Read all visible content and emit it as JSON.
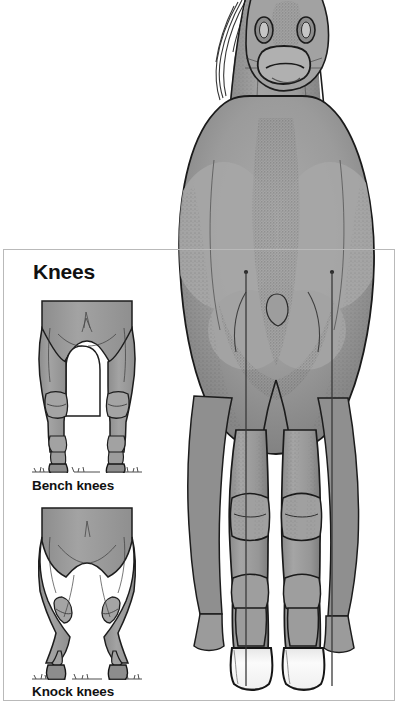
{
  "figure": {
    "plumb_lines": 2,
    "colors": {
      "body_fill": "#9a9a9a",
      "body_shadow": "#6f6f6f",
      "outline": "#1a1a1a",
      "hoof_fill": "#fdfdfd",
      "plumb_line": "#3a3a3a",
      "background": "#ffffff"
    }
  },
  "panel": {
    "title": "Knees",
    "border_color": "#b9b9b9",
    "diagrams": [
      {
        "id": "bench-knees",
        "caption": "Bench knees",
        "description": "Front legs viewed from the front; cannon bones set to the outside of the knees, legs appear offset"
      },
      {
        "id": "knock-knees",
        "caption": "Knock knees",
        "description": "Front legs viewed from the front; knees deviate inward toward each other, cannons and hooves splay outward"
      }
    ]
  }
}
